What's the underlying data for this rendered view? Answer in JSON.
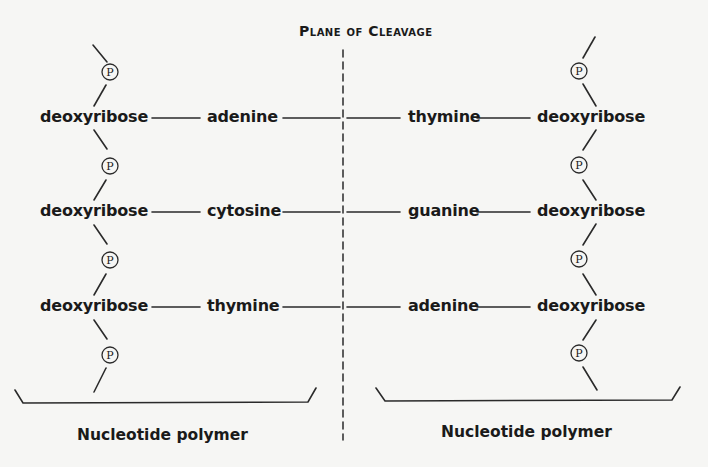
{
  "diagram": {
    "title": "Plane of Cleavage",
    "left_strand": {
      "caption": "Nucleotide polymer",
      "rows": [
        {
          "sugar": "deoxyribose",
          "base": "adenine"
        },
        {
          "sugar": "deoxyribose",
          "base": "cytosine"
        },
        {
          "sugar": "deoxyribose",
          "base": "thymine"
        }
      ]
    },
    "right_strand": {
      "caption": "Nucleotide polymer",
      "rows": [
        {
          "base": "thymine",
          "sugar": "deoxyribose"
        },
        {
          "base": "guanine",
          "sugar": "deoxyribose"
        },
        {
          "base": "adenine",
          "sugar": "deoxyribose"
        }
      ]
    },
    "phosphate_symbol": "P",
    "base_pairs": [
      [
        "adenine",
        "thymine"
      ],
      [
        "cytosine",
        "guanine"
      ],
      [
        "thymine",
        "adenine"
      ]
    ]
  }
}
